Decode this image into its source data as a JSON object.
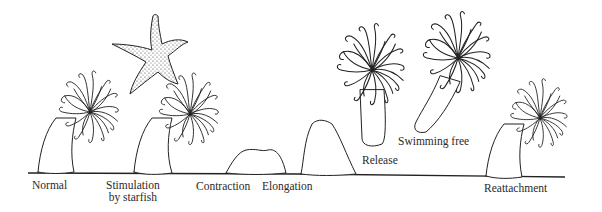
{
  "figure": {
    "ground_color": "#222222",
    "ink_color": "#222222",
    "stages": [
      {
        "id": "normal",
        "label": "Normal"
      },
      {
        "id": "stimulation",
        "label_line1": "Stimulation",
        "label_line2": "by starfish"
      },
      {
        "id": "contraction",
        "label": "Contraction"
      },
      {
        "id": "elongation",
        "label": "Elongation"
      },
      {
        "id": "release",
        "label": "Release"
      },
      {
        "id": "swimming",
        "label": "Swimming free"
      },
      {
        "id": "reattachment",
        "label": "Reattachment"
      }
    ]
  }
}
